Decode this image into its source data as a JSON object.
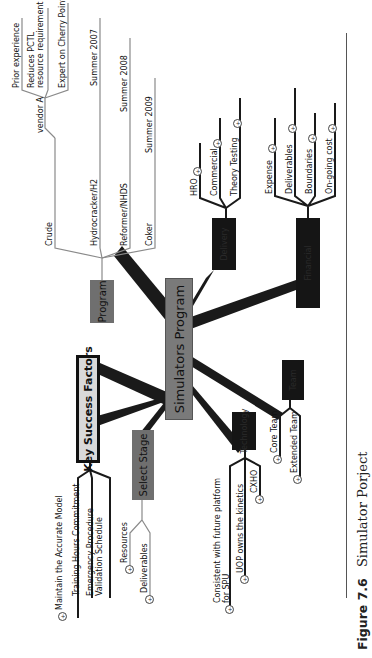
{
  "central": {
    "label": "Simulators Program"
  },
  "branches": {
    "program": {
      "label": "Program",
      "children": [
        {
          "label": "Crude",
          "note": "",
          "sub": {
            "label": "vendor A",
            "items": [
              "Prior experience",
              "Reduces PCTL resource requirement",
              "Expert on Cherry Point"
            ]
          }
        },
        {
          "label": "Hydrocracker/H2",
          "note": "Summer 2007"
        },
        {
          "label": "Reformer/NHDS",
          "note": "Summer 2008"
        },
        {
          "label": "Coker",
          "note": "Summer 2009"
        }
      ]
    },
    "delivery": {
      "label": "Delivery",
      "children": [
        "HRO",
        "Commercial",
        "Theory Testing"
      ]
    },
    "financial": {
      "label": "Financial",
      "children": [
        "Expense",
        "Deliverables",
        "Boundaries",
        "On-going cost"
      ]
    },
    "team": {
      "label": "Team",
      "children": [
        "Core Team",
        "Extended Team"
      ]
    },
    "technology": {
      "label": "Technology",
      "children": [
        "Consistent with future platform for SPU",
        "UOP owns the kinetics",
        "CXHO"
      ]
    },
    "select_stage": {
      "label": "Select Stage",
      "children": [
        "Resources",
        "Deliverables"
      ]
    },
    "ksf": {
      "label": "Key Success Factors",
      "children": [
        "Maintain the Accurate Model",
        "Training Hours Commitment",
        "Emergency Procedure Validation Schedule"
      ]
    }
  },
  "expand_icon": "plus-circle-icon",
  "caption": {
    "label": "Figure 7.6",
    "text": "Simulator Porject"
  },
  "colors": {
    "central": "#7a7a7a",
    "grey_node": "#6f6f6f",
    "dark_node": "#151515",
    "ksf_fill": "#d9d9d9",
    "connector": "#1a1a1a",
    "leaf_line": "#8a8a8a"
  }
}
